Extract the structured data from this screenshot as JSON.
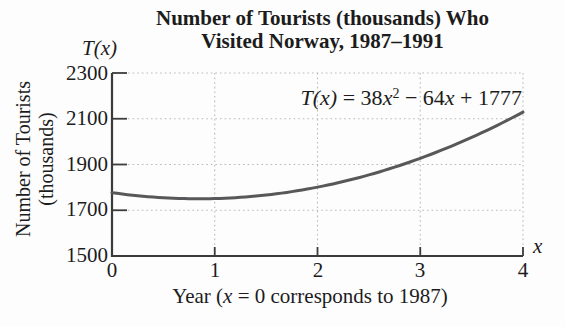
{
  "title": {
    "line1": "Number of Tourists (thousands) Who",
    "line2": "Visited Norway, 1987–1991"
  },
  "axes": {
    "y_axis_function_label": "T(x)",
    "y_label_line1": "Number of Tourists",
    "y_label_line2": "(thousands)",
    "y_ticks": [
      "2300",
      "2100",
      "1900",
      "1700",
      "1500"
    ],
    "x_ticks": [
      "0",
      "1",
      "2",
      "3",
      "4"
    ],
    "x_var": "x",
    "x_label": {
      "prefix": "Year (",
      "var": "x",
      "suffix": " = 0 corresponds to 1987)"
    }
  },
  "equation": {
    "fn": "T(x)",
    "eq": " = 38",
    "v1": "x",
    "sup": "2",
    "t2": " − 64",
    "v2": "x",
    "t3": " + 1777"
  },
  "colors": {
    "curve": "#58585a",
    "axis": "#3b3b3b",
    "grid": "#b9b9b9",
    "text": "#1c1c1c",
    "background": "#fdfdfd"
  },
  "chart_data": {
    "type": "line",
    "title": "Number of Tourists (thousands) Who Visited Norway, 1987–1991",
    "xlabel": "Year (x = 0 corresponds to 1987)",
    "ylabel": "Number of Tourists (thousands)",
    "equation": "T(x) = 38x^2 − 64x + 1777",
    "coefficients": {
      "a": 38,
      "b": -64,
      "c": 1777
    },
    "x_range": [
      0,
      4
    ],
    "y_range": [
      1500,
      2300
    ],
    "x_ticks": [
      0,
      1,
      2,
      3,
      4
    ],
    "y_ticks": [
      1500,
      1700,
      1900,
      2100,
      2300
    ],
    "points": [
      {
        "x": 0,
        "y": 1777
      },
      {
        "x": 1,
        "y": 1751
      },
      {
        "x": 2,
        "y": 1801
      },
      {
        "x": 3,
        "y": 1927
      },
      {
        "x": 4,
        "y": 2129
      }
    ],
    "grid": "dotted",
    "legend": "none"
  }
}
